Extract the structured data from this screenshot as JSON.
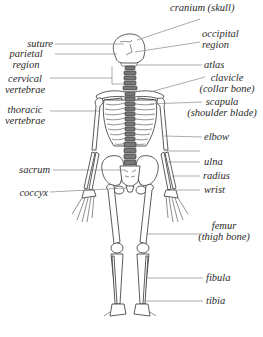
{
  "labels_left": [
    {
      "id": "suture",
      "lines": [
        "suture"
      ]
    },
    {
      "id": "parietal-region",
      "lines": [
        "parietal",
        "region"
      ]
    },
    {
      "id": "cervical-vertebrae",
      "lines": [
        "cervical",
        "vertebrae"
      ]
    },
    {
      "id": "thoracic-vertebrae",
      "lines": [
        "thoracic",
        "vertebrae"
      ]
    },
    {
      "id": "sacrum",
      "lines": [
        "sacrum"
      ]
    },
    {
      "id": "coccyx",
      "lines": [
        "coccyx"
      ]
    }
  ],
  "labels_right": [
    {
      "id": "cranium",
      "lines": [
        "cranium (skull)"
      ]
    },
    {
      "id": "occipital-region",
      "lines": [
        "occipital",
        "region"
      ]
    },
    {
      "id": "atlas",
      "lines": [
        "atlas"
      ]
    },
    {
      "id": "clavicle",
      "lines": [
        "clavicle",
        "(collar bone)"
      ]
    },
    {
      "id": "scapula",
      "lines": [
        "scapula",
        "(shoulder  blade)"
      ]
    },
    {
      "id": "elbow",
      "lines": [
        "elbow"
      ]
    },
    {
      "id": "ulna",
      "lines": [
        "ulna"
      ]
    },
    {
      "id": "radius",
      "lines": [
        "radius"
      ]
    },
    {
      "id": "wrist",
      "lines": [
        "wrist"
      ]
    },
    {
      "id": "femur",
      "lines": [
        "femur",
        "(thigh bone)"
      ]
    },
    {
      "id": "fibula",
      "lines": [
        "fibula"
      ]
    },
    {
      "id": "tibia",
      "lines": [
        "tibia"
      ]
    }
  ]
}
